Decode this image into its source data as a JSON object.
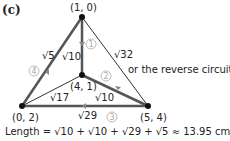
{
  "part_label": "(c)",
  "vertices": {
    "top": "(1, 0)",
    "center": "(4, 1)",
    "left": "(0, 2)",
    "right": "(5, 4)"
  },
  "edges": {
    "top_left": "√5",
    "top_center": "√10",
    "top_right": "√32",
    "left_center": "√17",
    "center_right": "√10",
    "left_right": "√29"
  },
  "step_numbers": [
    "1",
    "2",
    "3",
    "4"
  ],
  "note": "or the reverse circuit",
  "length_formula": "Length = √10 + √10 + √29 + √5 ≈ 13.95 cm",
  "colors": {
    "thick_edge": "#555555",
    "thin_edge": "#333333",
    "step_circle": "#aaaaaa"
  }
}
